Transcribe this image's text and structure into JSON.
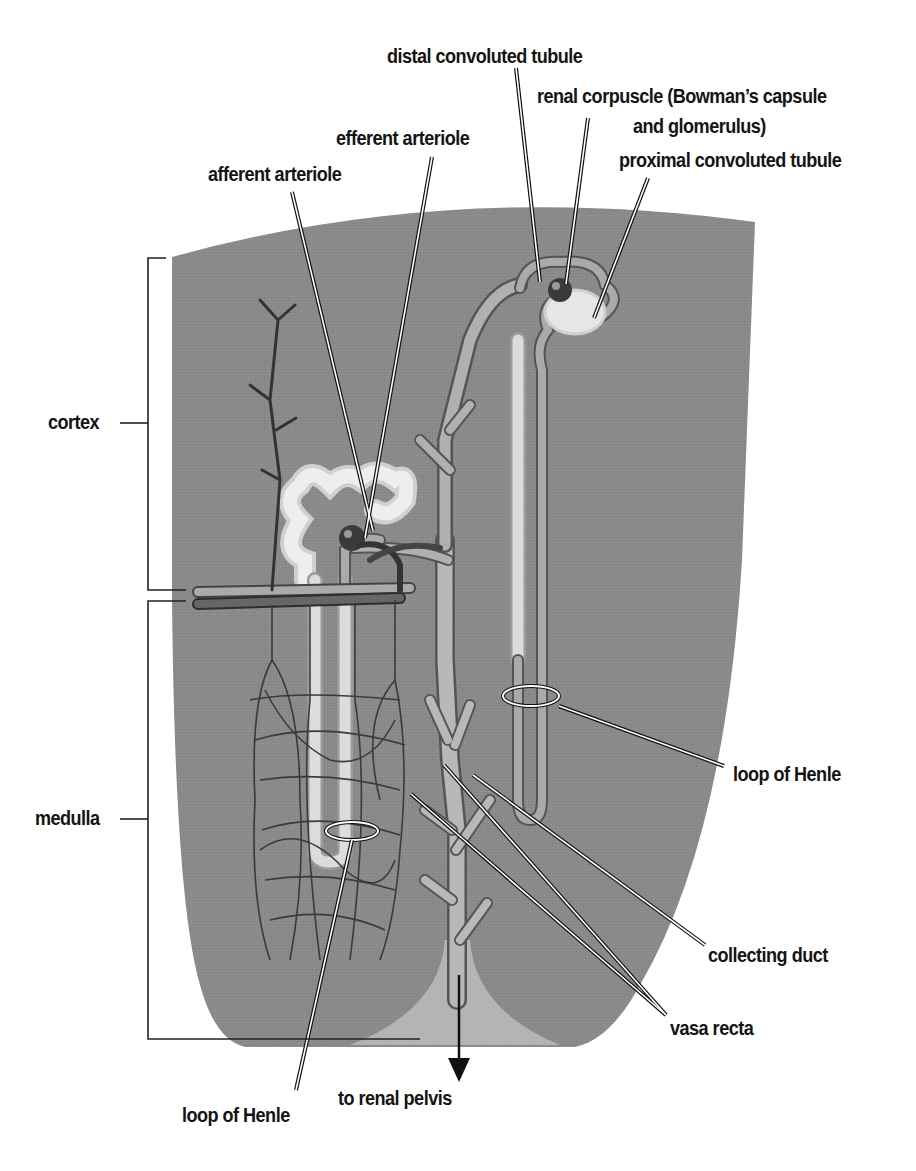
{
  "figure": {
    "colors": {
      "background": "#ffffff",
      "tissue": "#8a8a8a",
      "pelvis": "#b4b4b4",
      "tubule_light": "#dcdcdc",
      "tubule_mid": "#a8a8a8",
      "vessel_dark": "#4a4a4a",
      "label_text": "#141414",
      "leader_line_fill": "#ffffff",
      "leader_line_outline": "#111111"
    }
  },
  "labels": {
    "distal_convoluted_tubule": "distal convoluted tubule",
    "renal_corpuscle_line1": "renal corpuscle (Bowman’s capsule",
    "renal_corpuscle_line2": "and glomerulus)",
    "efferent_arteriole": "efferent arteriole",
    "afferent_arteriole": "afferent arteriole",
    "proximal_convoluted_tubule": "proximal convoluted tubule",
    "cortex": "cortex",
    "medulla": "medulla",
    "loop_of_henle_right": "loop of Henle",
    "collecting_duct": "collecting duct",
    "vasa_recta": "vasa recta",
    "to_renal_pelvis": "to renal pelvis",
    "loop_of_henle_bottom": "loop of Henle"
  },
  "regions": [
    {
      "name": "cortex",
      "bracket_top": 257,
      "bracket_bottom": 590
    },
    {
      "name": "medulla",
      "bracket_top": 601,
      "bracket_bottom": 1039
    }
  ]
}
